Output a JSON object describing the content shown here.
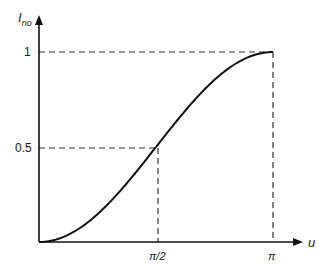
{
  "chart_data": {
    "type": "line",
    "title": "",
    "xlabel": "u",
    "ylabel": "I_no",
    "ylabel_main": "I",
    "ylabel_sub": "no",
    "x_ticks": [
      "π/2",
      "π"
    ],
    "y_ticks": [
      "0.5",
      "1"
    ],
    "xlim": [
      0,
      3.3
    ],
    "ylim": [
      0,
      1.1
    ],
    "grid": false,
    "series": [
      {
        "name": "I_no(u) = (1 - cos u)/2",
        "x": [
          0,
          0.3927,
          0.7854,
          1.1781,
          1.5708,
          1.9635,
          2.3562,
          2.7489,
          3.1416
        ],
        "y": [
          0,
          0.038,
          0.146,
          0.309,
          0.5,
          0.691,
          0.854,
          0.962,
          1.0
        ]
      }
    ],
    "annotations": [
      {
        "type": "dashed-guide",
        "point": [
          "π/2",
          0.5
        ]
      },
      {
        "type": "dashed-guide",
        "point": [
          "π",
          1
        ]
      }
    ]
  }
}
